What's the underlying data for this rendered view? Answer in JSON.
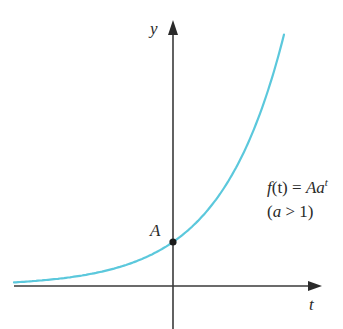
{
  "chart_data": {
    "type": "line",
    "title": "",
    "xlabel": "t",
    "ylabel": "y",
    "grid": false,
    "legend": null,
    "series": [
      {
        "name": "f(t) = Aa^t",
        "color": "#5bc8dc",
        "description": "Exponential growth curve with a > 1, passing through (0, A)",
        "points_pixel": [
          [
            14,
            282
          ],
          [
            60,
            279
          ],
          [
            100,
            272
          ],
          [
            140,
            261
          ],
          [
            173,
            242
          ],
          [
            200,
            219
          ],
          [
            230,
            176
          ],
          [
            260,
            106
          ],
          [
            284,
            32
          ]
        ]
      }
    ],
    "annotations": [
      {
        "text": "A",
        "meaning": "y-intercept point (0, A)"
      },
      {
        "text": "f(t) = Aa^t",
        "meaning": "function label"
      },
      {
        "text": "(a > 1)",
        "meaning": "condition"
      }
    ],
    "axes": {
      "x_arrow": true,
      "y_arrow": true,
      "tick_labels": []
    }
  },
  "labels": {
    "y_axis": "y",
    "t_axis": "t",
    "point": "A",
    "eq_lhs_f": "f",
    "eq_lhs_arg": "(t) = ",
    "eq_rhs": "Aa",
    "eq_exp": "t",
    "cond_open": "(",
    "cond_var": "a",
    "cond_rest": " > 1)"
  },
  "colors": {
    "curve": "#5bc8dc",
    "axis": "#2a2a2a",
    "point": "#1a1a1a"
  }
}
